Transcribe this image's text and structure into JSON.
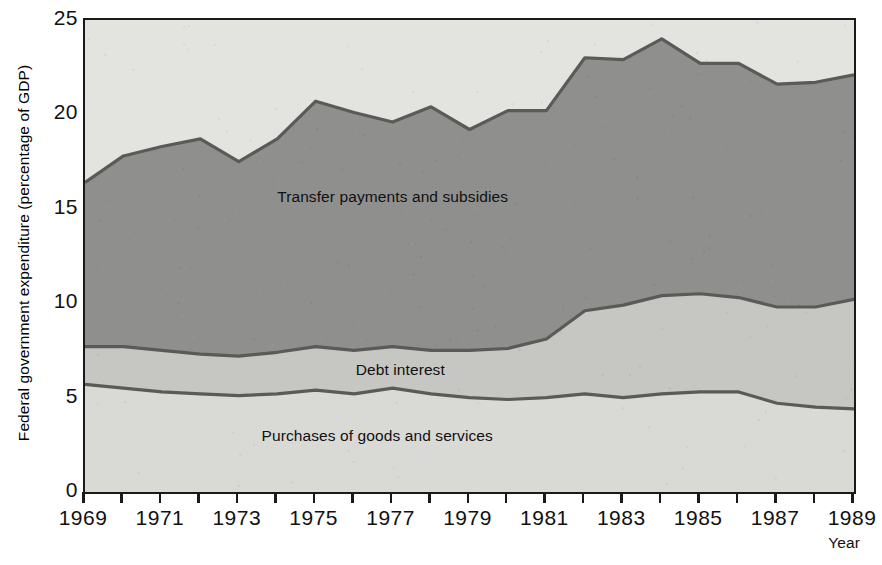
{
  "figure": {
    "ylabel": "Federal government expenditure (percentage of GDP)",
    "xlabel": "Year",
    "y_ticks": [
      "0",
      "5",
      "10",
      "15",
      "20",
      "25"
    ],
    "x_ticks": [
      "1969",
      "1971",
      "1973",
      "1975",
      "1977",
      "1979",
      "1981",
      "1983",
      "1985",
      "1987",
      "1989"
    ],
    "series_labels": {
      "transfers": "Transfer payments and subsidies",
      "debt": "Debt interest",
      "purchases": "Purchases of goods and services"
    },
    "colors": {
      "purchases_fill": "#d9d9d6",
      "debt_fill": "#c6c6c2",
      "transfers_fill": "#8f8f8d",
      "outside_fill": "#e3e3e0",
      "line": "#5a5a58",
      "axis": "#1a1a1a"
    }
  },
  "chart_data": {
    "type": "area",
    "stacked": true,
    "title": "",
    "xlabel": "Year",
    "ylabel": "Federal government expenditure (percentage of GDP)",
    "xlim": [
      1969,
      1989
    ],
    "ylim": [
      0,
      25
    ],
    "grid": false,
    "legend": "inline-annotations",
    "x": [
      1969,
      1970,
      1971,
      1972,
      1973,
      1974,
      1975,
      1976,
      1977,
      1978,
      1979,
      1980,
      1981,
      1982,
      1983,
      1984,
      1985,
      1986,
      1987,
      1988,
      1989
    ],
    "series": [
      {
        "name": "Purchases of goods and services",
        "values": [
          5.7,
          5.5,
          5.3,
          5.2,
          5.1,
          5.2,
          5.4,
          5.2,
          5.5,
          5.2,
          5.0,
          4.9,
          5.0,
          5.2,
          5.0,
          5.2,
          5.3,
          5.3,
          4.7,
          4.5,
          4.4
        ]
      },
      {
        "name": "Debt interest",
        "values": [
          2.0,
          2.2,
          2.2,
          2.1,
          2.1,
          2.2,
          2.3,
          2.3,
          2.2,
          2.3,
          2.5,
          2.7,
          3.1,
          4.4,
          4.9,
          5.2,
          5.2,
          5.0,
          5.1,
          5.3,
          5.8
        ]
      },
      {
        "name": "Transfer payments and subsidies",
        "values": [
          8.7,
          10.1,
          10.8,
          11.4,
          10.3,
          11.3,
          13.0,
          12.6,
          11.9,
          12.9,
          11.7,
          12.6,
          12.1,
          13.4,
          13.0,
          13.6,
          12.2,
          12.4,
          11.8,
          11.9,
          11.9
        ]
      }
    ],
    "totals": [
      16.4,
      17.8,
      18.3,
      18.7,
      17.5,
      18.7,
      20.7,
      20.1,
      19.6,
      20.4,
      19.2,
      20.2,
      20.2,
      23.0,
      22.9,
      24.0,
      22.7,
      22.7,
      21.6,
      21.7,
      22.1
    ]
  }
}
